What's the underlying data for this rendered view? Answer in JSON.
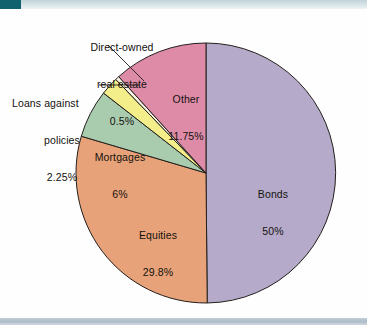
{
  "chart_data": {
    "type": "pie",
    "title": "",
    "subtitle": "",
    "xlabel": "",
    "ylabel": "",
    "legend_position": "callout-labels",
    "grid": false,
    "units": "percent",
    "total": 100,
    "start_angle_deg": 0,
    "direction": "clockwise",
    "categories": [
      "Bonds",
      "Equities",
      "Mortgages",
      "Loans against policies",
      "Direct-owned real estate",
      "Other"
    ],
    "values": [
      50,
      29.8,
      6,
      2.25,
      0.5,
      11.75
    ],
    "slices": [
      {
        "name": "Bonds",
        "label": "Bonds",
        "value_label": "50%",
        "value": 50,
        "color": "#b5aac9",
        "label_placement": "inside",
        "label_x": 273,
        "label_y": 170
      },
      {
        "name": "Equities",
        "label": "Equities",
        "value_label": "29.8%",
        "value": 29.8,
        "color": "#e7a279",
        "label_placement": "inside",
        "label_x": 158,
        "label_y": 211
      },
      {
        "name": "Mortgages",
        "label": "Mortgages",
        "value_label": "6%",
        "value": 6,
        "color": "#a9cbae",
        "label_placement": "inside",
        "label_x": 120,
        "label_y": 133
      },
      {
        "name": "Loans against policies",
        "label_line1": "Loans against",
        "label_line2": "policies",
        "value_label": "2.25%",
        "value": 2.25,
        "color": "#f3ee8a",
        "label_placement": "callout-left",
        "leader": true
      },
      {
        "name": "Direct-owned real estate",
        "label_line1": "Direct-owned",
        "label_line2": "real estate",
        "value_label": "0.5%",
        "value": 0.5,
        "color": "#f7f4e4",
        "label_placement": "callout-top-left",
        "leader": true
      },
      {
        "name": "Other",
        "label": "Other",
        "value_label": "11.75%",
        "value": 11.75,
        "color": "#dd8ba7",
        "label_placement": "inside",
        "label_x": 186,
        "label_y": 75
      }
    ]
  },
  "labels": {
    "direct_owned": {
      "line1": "Direct-owned",
      "line2": "real estate",
      "line3": "0.5%"
    },
    "loans": {
      "line1": "Loans against",
      "line2": "policies",
      "line3": "2.25%"
    },
    "mortgages": {
      "line1": "Mortgages",
      "line2": "6%"
    },
    "other": {
      "line1": "Other",
      "line2": "11.75%"
    },
    "bonds": {
      "line1": "Bonds",
      "line2": "50%"
    },
    "equities": {
      "line1": "Equities",
      "line2": "29.8%"
    }
  },
  "colors": {
    "bonds": "#b5aac9",
    "equities": "#e7a279",
    "mortgages": "#a9cbae",
    "loans": "#f3ee8a",
    "direct_owned": "#f7f4e4",
    "other": "#dd8ba7",
    "slice_outline": "#231f1c",
    "top_band": "#cfdce0",
    "top_tab": "#11626f",
    "bottom_band": "#aebcc8",
    "text": "#14120f",
    "background": "#fefefe"
  },
  "geometry": {
    "center_x": 206,
    "center_y": 164,
    "radius": 130
  }
}
